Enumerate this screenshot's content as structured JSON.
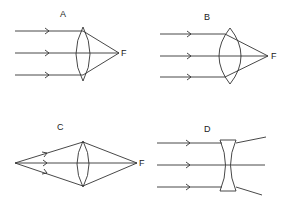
{
  "diagram": {
    "panels": [
      {
        "id": "A",
        "label": "A",
        "type": "converging lens, parallel rays",
        "focus_label": "F"
      },
      {
        "id": "B",
        "label": "B",
        "type": "thicker converging lens, parallel rays",
        "focus_label": "F"
      },
      {
        "id": "C",
        "label": "C",
        "type": "converging lens, diverging rays from point source",
        "focus_label": "F"
      },
      {
        "id": "D",
        "label": "D",
        "type": "diverging (concave) lens, parallel rays",
        "focus_label": ""
      }
    ]
  },
  "colors": {
    "line": "#333333",
    "background": "#ffffff"
  }
}
